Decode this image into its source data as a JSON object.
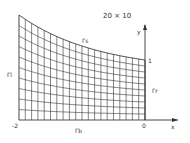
{
  "figure": {
    "title": "20 × 10",
    "axes": {
      "x_label": "x",
      "y_label": "y",
      "x_ticks": [
        "-2",
        "0"
      ],
      "y_tick_top": "1"
    },
    "boundaries": {
      "top": "Γs",
      "left": "Γl",
      "right": "Γr",
      "bottom": "Γb"
    },
    "grid": {
      "nx": 20,
      "ny": 10,
      "x_min": -2,
      "x_max": 0,
      "left_height_px": 105,
      "right_height_px": 60
    },
    "colors": {
      "line": "#333333",
      "background": "#ffffff"
    }
  }
}
